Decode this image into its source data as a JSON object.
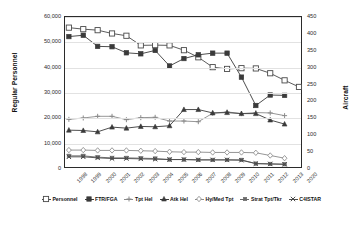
{
  "chart_data": {
    "type": "line",
    "title": "",
    "xlabel": "",
    "ylabel": "Regular Personnel",
    "ylabel_right": "Aircraft",
    "grid": true,
    "legend_position": "bottom",
    "categories": [
      "1998",
      "1999",
      "2000",
      "2001",
      "2002",
      "2003",
      "2004",
      "2005",
      "2006",
      "2007",
      "2008",
      "2009",
      "2010",
      "2011",
      "2012",
      "2013",
      "2020"
    ],
    "ylim": [
      0,
      60000
    ],
    "yticks": [
      "0",
      "10,000",
      "20,000",
      "30,000",
      "40,000",
      "50,000",
      "60,000"
    ],
    "ytick_values": [
      0,
      10000,
      20000,
      30000,
      40000,
      50000,
      60000
    ],
    "ylim_right": [
      0,
      450
    ],
    "yticks_right": [
      "0",
      "50",
      "100",
      "150",
      "200",
      "250",
      "300",
      "350",
      "400",
      "450"
    ],
    "ytick_values_right": [
      0,
      50,
      100,
      150,
      200,
      250,
      300,
      350,
      400,
      450
    ],
    "series": [
      {
        "name": "Personnel",
        "axis": "left",
        "marker": "open-square",
        "color": "#4a4a4a",
        "values": [
          55800,
          55200,
          54800,
          53500,
          52600,
          48800,
          48900,
          48800,
          46900,
          44100,
          40200,
          39500,
          39800,
          39700,
          37800,
          35000,
          32400
        ]
      },
      {
        "name": "FTR/FGA",
        "axis": "right",
        "marker": "filled-square",
        "color": "#3a3a3a",
        "values": [
          392,
          396,
          363,
          362,
          344,
          341,
          351,
          305,
          327,
          338,
          343,
          343,
          272,
          188,
          219,
          218,
          null
        ]
      },
      {
        "name": "Tpt Hel",
        "axis": "right",
        "marker": "cross-plus",
        "color": "#8a8a8a",
        "values": [
          147,
          151,
          156,
          156,
          146,
          152,
          153,
          142,
          142,
          140,
          165,
          169,
          164,
          167,
          166,
          158,
          null
        ]
      },
      {
        "name": "Atk Hel",
        "axis": "right",
        "marker": "filled-triangle",
        "color": "#3a3a3a",
        "values": [
          115,
          114,
          110,
          124,
          121,
          126,
          125,
          128,
          176,
          176,
          166,
          167,
          164,
          164,
          145,
          133,
          null
        ]
      },
      {
        "name": "Hy/Med Tpt",
        "axis": "right",
        "marker": "open-diamond",
        "color": "#8a8a8a",
        "values": [
          56,
          56,
          55,
          55,
          55,
          54,
          53,
          51,
          50,
          50,
          49,
          49,
          49,
          48,
          40,
          32,
          null
        ]
      },
      {
        "name": "Strat Tpt/Tkr",
        "axis": "right",
        "marker": "filled-square-sm",
        "color": "#6a6a6a",
        "values": [
          39,
          39,
          35,
          33,
          33,
          32,
          31,
          28,
          28,
          27,
          27,
          27,
          27,
          16,
          15,
          14,
          null
        ]
      },
      {
        "name": "C4ISTAR",
        "axis": "right",
        "marker": "cross-x",
        "color": "#4a4a4a",
        "values": [
          36,
          36,
          33,
          31,
          31,
          30,
          29,
          28,
          28,
          27,
          27,
          27,
          26,
          16,
          15,
          14,
          null
        ]
      }
    ]
  }
}
